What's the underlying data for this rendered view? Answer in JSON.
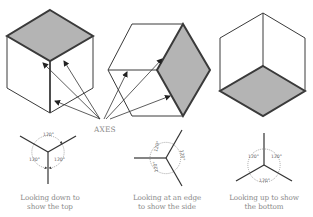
{
  "diagram": {
    "axes_label": "AXES",
    "colors": {
      "stroke": "#3a3a3a",
      "shaded_face": "#b4b4b4",
      "caption": "#8a8a8a",
      "background": "#ffffff"
    },
    "views": [
      {
        "id": "top",
        "shaded_face": "top",
        "caption_line1": "Looking down to",
        "caption_line2": "show the top",
        "angles": [
          "120°",
          "120°",
          "120°"
        ]
      },
      {
        "id": "side",
        "shaded_face": "side",
        "caption_line1": "Looking at an edge",
        "caption_line2": "to show the side",
        "angles": [
          "120°",
          "120°",
          "120°"
        ]
      },
      {
        "id": "bottom",
        "shaded_face": "bottom",
        "caption_line1": "Looking up to show",
        "caption_line2": "the bottom",
        "angles": [
          "120°",
          "120°",
          "120°"
        ]
      }
    ]
  }
}
